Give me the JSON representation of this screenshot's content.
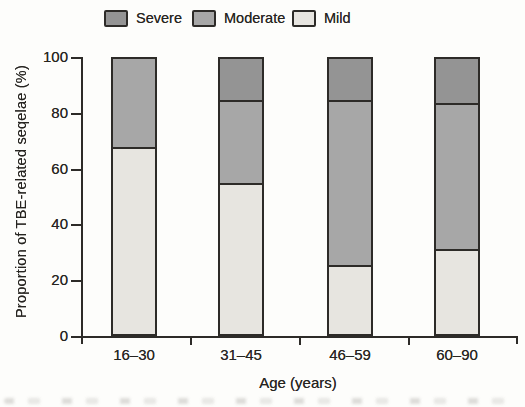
{
  "figure": {
    "background": "#fdfdfb",
    "ink_color": "#2d2b28"
  },
  "chart_data": {
    "type": "bar",
    "stacked": true,
    "title": "",
    "categories": [
      "16–30",
      "31–45",
      "46–59",
      "60–90"
    ],
    "series": [
      {
        "name": "Severe",
        "color": "#949494",
        "values": [
          0,
          15,
          15,
          16
        ]
      },
      {
        "name": "Moderate",
        "color": "#a7a7a7",
        "values": [
          32,
          30,
          60,
          53
        ]
      },
      {
        "name": "Mild",
        "color": "#e7e5e0",
        "values": [
          68,
          55,
          25,
          31
        ]
      }
    ],
    "xlabel": "Age (years)",
    "ylabel": "Proportion of TBE-related seqelae (%)",
    "ylim": [
      0,
      100
    ],
    "yticks": [
      0,
      20,
      40,
      60,
      80,
      100
    ],
    "grid": false,
    "legend_position": "top",
    "bar_outline": true
  }
}
